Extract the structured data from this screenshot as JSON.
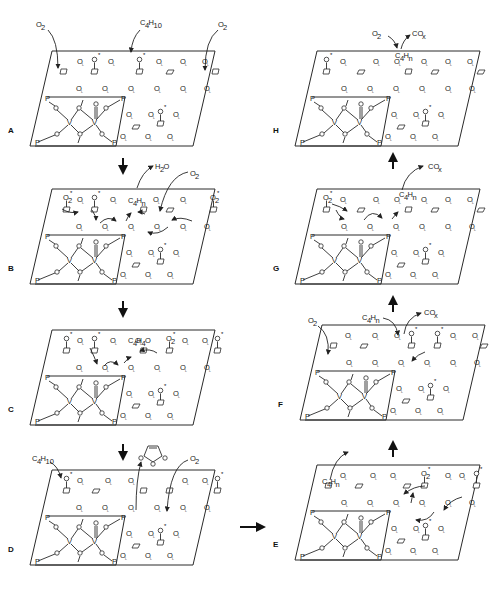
{
  "diagram": {
    "panels": [
      {
        "id": "A",
        "label": "A",
        "species_in": [
          "O2",
          "C4H10",
          "O2"
        ],
        "species_out": []
      },
      {
        "id": "B",
        "label": "B",
        "species_in": [
          "O2"
        ],
        "species_out": [
          "H2O"
        ],
        "adsorbate": "C4Hn"
      },
      {
        "id": "C",
        "label": "C",
        "species_in": [],
        "species_out": [],
        "adsorbate": "C4H4O",
        "surface_o2": "O2"
      },
      {
        "id": "D",
        "label": "D",
        "species_in": [
          "C4H10",
          "O2"
        ],
        "species_out": [
          "maleic anhydride"
        ]
      },
      {
        "id": "E",
        "label": "E",
        "species_in": [],
        "species_out": [],
        "adsorbate": "C4Hn",
        "surface_o2": "O2"
      },
      {
        "id": "F",
        "label": "F",
        "species_in": [
          "O2",
          "C4Hn"
        ],
        "species_out": [
          "COx"
        ]
      },
      {
        "id": "G",
        "label": "G",
        "species_in": [],
        "species_out": [
          "COx"
        ],
        "adsorbate": "C4Hn",
        "surface_o2": "O2"
      },
      {
        "id": "H",
        "label": "H",
        "species_in": [
          "O2"
        ],
        "species_out": [
          "COx"
        ],
        "adsorbate": "C4Hn"
      }
    ],
    "text": {
      "o2": "O",
      "o2_sub": "2",
      "c4h10": "C",
      "c4h10_sub1": "4",
      "c4h10_mid": "H",
      "c4h10_sub2": "10",
      "c4hn_sub2": "n",
      "c4h4o_sub2": "4",
      "c4h4o_tail": "O",
      "h2o_h": "H",
      "h2o_sub": "2",
      "h2o_o": "O",
      "cox": "CO",
      "cox_sub": "x",
      "lattice_o": "O",
      "lattice_sub": "L",
      "active_o": "O",
      "star": "*",
      "v": "V",
      "p": "P"
    },
    "flow": [
      "A→B",
      "B→C",
      "C→D",
      "D→E",
      "E→F",
      "F→G",
      "G→H"
    ],
    "colors": {
      "ink": "#2a2a2a",
      "background": "#ffffff"
    }
  }
}
